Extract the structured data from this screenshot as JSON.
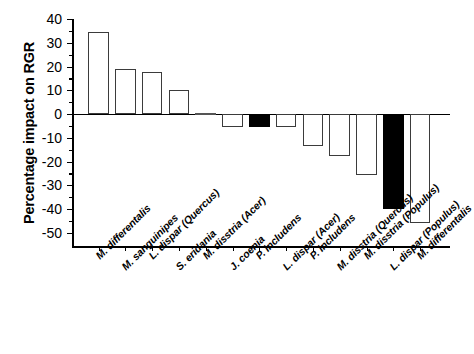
{
  "figure": {
    "ylabel": "Percentage impact on RGR"
  },
  "chart_data": {
    "type": "bar",
    "title": "",
    "xlabel": "",
    "ylabel": "Percentage impact on RGR",
    "ylim": [
      -50,
      40
    ],
    "yticks": [
      40,
      30,
      20,
      10,
      0,
      -10,
      -20,
      -30,
      -40,
      -50
    ],
    "ytick_labels": [
      "40",
      "30",
      "20",
      "10",
      "0",
      "-10",
      "-20",
      "-30",
      "-40",
      "-50"
    ],
    "grid": false,
    "legend": "none",
    "minor_ticks": true,
    "zero_reference_line": true,
    "categories": [
      "M. differentalis",
      "M. sanguinipes",
      "L. dispar (Quercus)",
      "S. eridania",
      "M. disstria (Acer)",
      "J. coenia",
      "P. includens",
      "L. dispar (Acer)",
      "P. includens",
      "M. disstria (Quercus)",
      "M. disstria (Populus)",
      "L. dispar (Populus)",
      "M. differentalis"
    ],
    "values": [
      34.5,
      18.8,
      17.8,
      10.0,
      -0.3,
      -5.5,
      -5.5,
      -5.5,
      -13.5,
      -17.5,
      -25.5,
      -40.0,
      -46.0
    ],
    "bar_fill": [
      "open",
      "open",
      "open",
      "open",
      "open",
      "open",
      "filled",
      "open",
      "open",
      "open",
      "open",
      "filled",
      "open"
    ],
    "colors": {
      "open": "#ffffff",
      "filled": "#000000",
      "edge": "#3b3b3b",
      "axis": "#000000"
    }
  }
}
